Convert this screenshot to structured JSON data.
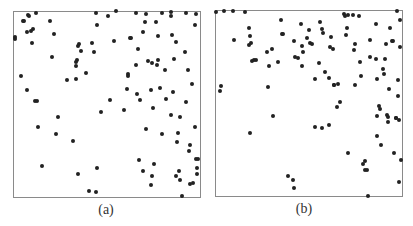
{
  "chart_data": [
    {
      "type": "scatter",
      "caption": "(a)",
      "title": "",
      "xlabel": "",
      "ylabel": "",
      "grid": false,
      "legend": null,
      "panel_box": {
        "left": 13,
        "top": 11,
        "width": 188,
        "height": 187
      },
      "points_px": [
        [
          15,
          37
        ],
        [
          15,
          39
        ],
        [
          23,
          21
        ],
        [
          24,
          21
        ],
        [
          28,
          15
        ],
        [
          27,
          32
        ],
        [
          31,
          31
        ],
        [
          33,
          29
        ],
        [
          32,
          43
        ],
        [
          36,
          13
        ],
        [
          29,
          16
        ],
        [
          21,
          76
        ],
        [
          27,
          90
        ],
        [
          35,
          101
        ],
        [
          37,
          101
        ],
        [
          38,
          127
        ],
        [
          42,
          166
        ],
        [
          50,
          21
        ],
        [
          52,
          57
        ],
        [
          54,
          34
        ],
        [
          56,
          134
        ],
        [
          58,
          117
        ],
        [
          67,
          80
        ],
        [
          73,
          141
        ],
        [
          76,
          62
        ],
        [
          77,
          60
        ],
        [
          76,
          66
        ],
        [
          76,
          79
        ],
        [
          78,
          174
        ],
        [
          78,
          46
        ],
        [
          79,
          44
        ],
        [
          81,
          51
        ],
        [
          86,
          73
        ],
        [
          89,
          191
        ],
        [
          92,
          43
        ],
        [
          94,
          52
        ],
        [
          96,
          192
        ],
        [
          97,
          168
        ],
        [
          97,
          25
        ],
        [
          101,
          112
        ],
        [
          96,
          13
        ],
        [
          108,
          16
        ],
        [
          110,
          100
        ],
        [
          114,
          41
        ],
        [
          116,
          11
        ],
        [
          124,
          110
        ],
        [
          128,
          74
        ],
        [
          127,
          89
        ],
        [
          128,
          76
        ],
        [
          130,
          38
        ],
        [
          131,
          38
        ],
        [
          136,
          13
        ],
        [
          138,
          49
        ],
        [
          136,
          65
        ],
        [
          137,
          94
        ],
        [
          139,
          160
        ],
        [
          140,
          100
        ],
        [
          143,
          171
        ],
        [
          146,
          14
        ],
        [
          143,
          32
        ],
        [
          145,
          22
        ],
        [
          148,
          61
        ],
        [
          146,
          129
        ],
        [
          152,
          176
        ],
        [
          151,
          185
        ],
        [
          154,
          164
        ],
        [
          153,
          108
        ],
        [
          151,
          90
        ],
        [
          152,
          63
        ],
        [
          156,
          22
        ],
        [
          158,
          36
        ],
        [
          157,
          65
        ],
        [
          158,
          60
        ],
        [
          160,
          88
        ],
        [
          162,
          134
        ],
        [
          162,
          13
        ],
        [
          165,
          70
        ],
        [
          166,
          99
        ],
        [
          171,
          12
        ],
        [
          172,
          35
        ],
        [
          173,
          92
        ],
        [
          171,
          16
        ],
        [
          171,
          115
        ],
        [
          174,
          59
        ],
        [
          176,
          42
        ],
        [
          178,
          133
        ],
        [
          177,
          142
        ],
        [
          179,
          171
        ],
        [
          180,
          180
        ],
        [
          176,
          176
        ],
        [
          180,
          117
        ],
        [
          182,
          196
        ],
        [
          185,
          52
        ],
        [
          186,
          102
        ],
        [
          186,
          13
        ],
        [
          189,
          151
        ],
        [
          188,
          70
        ],
        [
          190,
          145
        ],
        [
          192,
          84
        ],
        [
          190,
          184
        ],
        [
          193,
          183
        ],
        [
          195,
          25
        ],
        [
          195,
          127
        ],
        [
          196,
          159
        ],
        [
          197,
          174
        ],
        [
          197,
          168
        ],
        [
          198,
          159
        ],
        [
          196,
          14
        ]
      ]
    },
    {
      "type": "scatter",
      "caption": "(b)",
      "title": "",
      "xlabel": "",
      "ylabel": "",
      "grid": false,
      "legend": null,
      "panel_box": {
        "left": 215,
        "top": 10,
        "width": 188,
        "height": 187
      },
      "points_px": [
        [
          216,
          12
        ],
        [
          224,
          11
        ],
        [
          233,
          11
        ],
        [
          245,
          12
        ],
        [
          221,
          86
        ],
        [
          220,
          91
        ],
        [
          234,
          40
        ],
        [
          249,
          28
        ],
        [
          250,
          36
        ],
        [
          249,
          45
        ],
        [
          251,
          43
        ],
        [
          252,
          61
        ],
        [
          254,
          60
        ],
        [
          256,
          60
        ],
        [
          250,
          133
        ],
        [
          267,
          52
        ],
        [
          268,
          87
        ],
        [
          269,
          66
        ],
        [
          272,
          49
        ],
        [
          273,
          116
        ],
        [
          278,
          62
        ],
        [
          281,
          20
        ],
        [
          282,
          34
        ],
        [
          283,
          34
        ],
        [
          288,
          176
        ],
        [
          293,
          180
        ],
        [
          294,
          188
        ],
        [
          294,
          41
        ],
        [
          295,
          57
        ],
        [
          298,
          58
        ],
        [
          301,
          24
        ],
        [
          302,
          46
        ],
        [
          303,
          52
        ],
        [
          302,
          66
        ],
        [
          307,
          38
        ],
        [
          309,
          30
        ],
        [
          310,
          43
        ],
        [
          312,
          44
        ],
        [
          315,
          79
        ],
        [
          315,
          127
        ],
        [
          320,
          22
        ],
        [
          319,
          63
        ],
        [
          322,
          29
        ],
        [
          323,
          33
        ],
        [
          325,
          72
        ],
        [
          322,
          128
        ],
        [
          330,
          47
        ],
        [
          331,
          37
        ],
        [
          329,
          78
        ],
        [
          333,
          49
        ],
        [
          334,
          85
        ],
        [
          329,
          125
        ],
        [
          334,
          85
        ],
        [
          337,
          107
        ],
        [
          338,
          84
        ],
        [
          340,
          102
        ],
        [
          344,
          14
        ],
        [
          345,
          16
        ],
        [
          347,
          28
        ],
        [
          346,
          35
        ],
        [
          348,
          15
        ],
        [
          348,
          153
        ],
        [
          353,
          15
        ],
        [
          359,
          16
        ],
        [
          354,
          50
        ],
        [
          355,
          44
        ],
        [
          360,
          62
        ],
        [
          361,
          76
        ],
        [
          355,
          85
        ],
        [
          363,
          164
        ],
        [
          365,
          161
        ],
        [
          365,
          170
        ],
        [
          367,
          170
        ],
        [
          368,
          196
        ],
        [
          370,
          57
        ],
        [
          370,
          40
        ],
        [
          376,
          24
        ],
        [
          376,
          59
        ],
        [
          377,
          79
        ],
        [
          377,
          116
        ],
        [
          377,
          136
        ],
        [
          379,
          106
        ],
        [
          380,
          109
        ],
        [
          381,
          145
        ],
        [
          383,
          69
        ],
        [
          384,
          74
        ],
        [
          385,
          59
        ],
        [
          386,
          44
        ],
        [
          387,
          115
        ],
        [
          388,
          122
        ],
        [
          388,
          117
        ],
        [
          389,
          89
        ],
        [
          390,
          28
        ],
        [
          392,
          41
        ],
        [
          393,
          41
        ],
        [
          394,
          153
        ],
        [
          396,
          118
        ],
        [
          396,
          118
        ],
        [
          397,
          11
        ],
        [
          398,
          96
        ],
        [
          398,
          80
        ],
        [
          399,
          120
        ],
        [
          399,
          182
        ],
        [
          400,
          20
        ],
        [
          400,
          47
        ],
        [
          401,
          160
        ]
      ]
    }
  ],
  "captions": {
    "a": "(a)",
    "b": "(b)"
  }
}
